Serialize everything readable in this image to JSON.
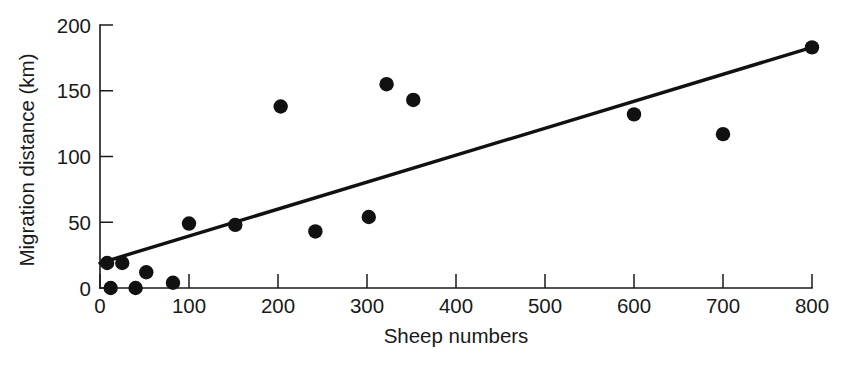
{
  "chart_data": {
    "type": "scatter",
    "title": "",
    "xlabel": "Sheep numbers",
    "ylabel": "Migration distance (km)",
    "xlim": [
      0,
      800
    ],
    "ylim": [
      0,
      200
    ],
    "xticks": [
      0,
      100,
      200,
      300,
      400,
      500,
      600,
      700,
      800
    ],
    "yticks": [
      0,
      50,
      100,
      150,
      200
    ],
    "grid": false,
    "legend": null,
    "point_color": "#111111",
    "line_color": "#111111",
    "points": [
      {
        "x": 8,
        "y": 19
      },
      {
        "x": 12,
        "y": 0
      },
      {
        "x": 25,
        "y": 19
      },
      {
        "x": 40,
        "y": 0
      },
      {
        "x": 52,
        "y": 12
      },
      {
        "x": 82,
        "y": 4
      },
      {
        "x": 100,
        "y": 49
      },
      {
        "x": 152,
        "y": 48
      },
      {
        "x": 203,
        "y": 138
      },
      {
        "x": 242,
        "y": 43
      },
      {
        "x": 302,
        "y": 54
      },
      {
        "x": 322,
        "y": 155
      },
      {
        "x": 352,
        "y": 143
      },
      {
        "x": 600,
        "y": 132
      },
      {
        "x": 700,
        "y": 117
      },
      {
        "x": 800,
        "y": 183
      }
    ],
    "trend_line": {
      "name": "regression line",
      "x_start": 0,
      "y_start": 19,
      "x_end": 800,
      "y_end": 183
    }
  },
  "axes": {
    "x_tick_labels": [
      "0",
      "100",
      "200",
      "300",
      "400",
      "500",
      "600",
      "700",
      "800"
    ],
    "y_tick_labels": [
      "0",
      "50",
      "100",
      "150",
      "200"
    ],
    "x_axis_title": "Sheep numbers",
    "y_axis_title": "Migration distance (km)"
  }
}
